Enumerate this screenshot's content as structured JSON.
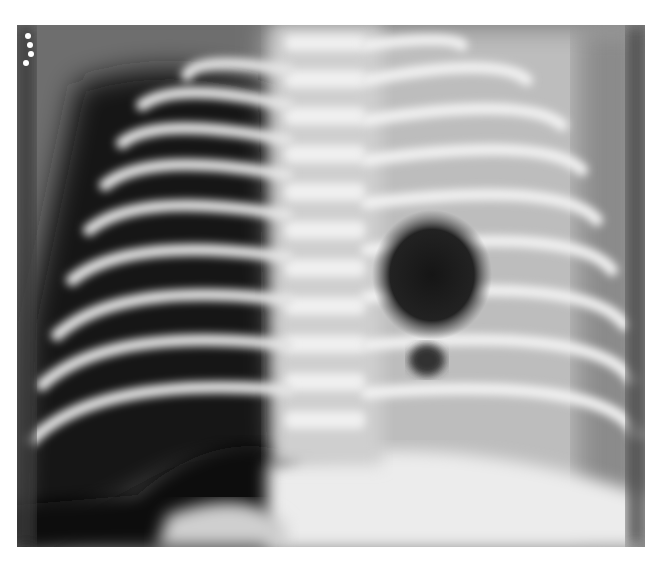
{
  "image": {
    "type": "chest radiograph",
    "description": "Frontal chest X-ray showing ribs, spine, a large dark lucent region on the left hemithorax (viewer's left) and a round dark lucency in the right mid-thorax adjacent to the spine",
    "markers": 4,
    "palette": {
      "background": "#ffffff",
      "film_dark": "#101010",
      "film_mid": "#7a7a7a",
      "bone": "#e8e8e8"
    }
  }
}
